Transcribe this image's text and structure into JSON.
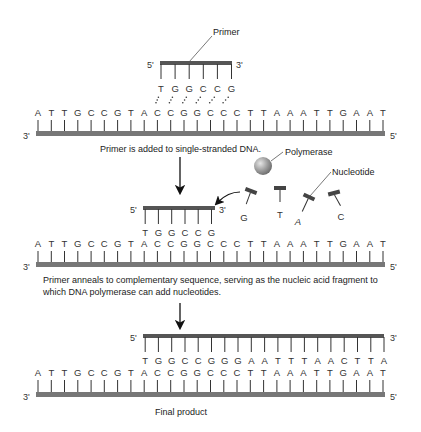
{
  "panel1": {
    "primer_label": "Primer",
    "primer_5": "5'",
    "primer_3": "3'",
    "primer_bases": [
      "T",
      "G",
      "G",
      "C",
      "C",
      "G"
    ],
    "template_3": "3'",
    "template_5": "5'",
    "template_bases": [
      "A",
      "T",
      "T",
      "G",
      "C",
      "C",
      "G",
      "T",
      "A",
      "C",
      "C",
      "G",
      "G",
      "C",
      "C",
      "C",
      "T",
      "T",
      "A",
      "A",
      "A",
      "T",
      "T",
      "G",
      "A",
      "A",
      "T"
    ],
    "caption": "Primer is added to single-stranded DNA."
  },
  "panel2": {
    "polymerase_label": "Polymerase",
    "nucleotide_label": "Nucleotide",
    "free_nucleotides": [
      "G",
      "T",
      "A",
      "C"
    ],
    "primer_5": "5'",
    "primer_3": "3'",
    "primer_bases": [
      "T",
      "G",
      "G",
      "C",
      "C",
      "G"
    ],
    "template_3": "3'",
    "template_5": "5'",
    "template_bases": [
      "A",
      "T",
      "T",
      "G",
      "C",
      "C",
      "G",
      "T",
      "A",
      "C",
      "C",
      "G",
      "G",
      "C",
      "C",
      "C",
      "T",
      "T",
      "A",
      "A",
      "A",
      "T",
      "T",
      "G",
      "A",
      "A",
      "T"
    ],
    "caption_line1": "Primer anneals to complementary sequence, serving as the nucleic acid fragment to",
    "caption_line2": "which DNA polymerase can add nucleotides."
  },
  "panel3": {
    "new_5": "5'",
    "new_3": "3'",
    "new_bases": [
      "T",
      "G",
      "G",
      "C",
      "C",
      "G",
      "G",
      "G",
      "A",
      "A",
      "T",
      "T",
      "T",
      "A",
      "A",
      "C",
      "T",
      "T",
      "A"
    ],
    "template_3": "3'",
    "template_5": "5'",
    "template_bases": [
      "A",
      "T",
      "T",
      "G",
      "C",
      "C",
      "G",
      "T",
      "A",
      "C",
      "C",
      "G",
      "G",
      "C",
      "C",
      "C",
      "T",
      "T",
      "A",
      "A",
      "A",
      "T",
      "T",
      "G",
      "A",
      "A",
      "T"
    ],
    "caption": "Final product"
  },
  "colors": {
    "backbone": "#6e6e6e",
    "primer_backbone": "#555555",
    "text": "#222222"
  }
}
